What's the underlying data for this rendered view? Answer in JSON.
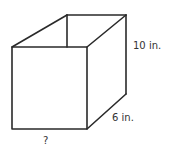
{
  "figure": {
    "type": "rectangular-prism",
    "labels": {
      "height": "10 in.",
      "depth": "6 in.",
      "width": "?"
    },
    "colors": {
      "stroke": "#2a2a2a",
      "text": "#333333",
      "background": "#ffffff"
    }
  }
}
